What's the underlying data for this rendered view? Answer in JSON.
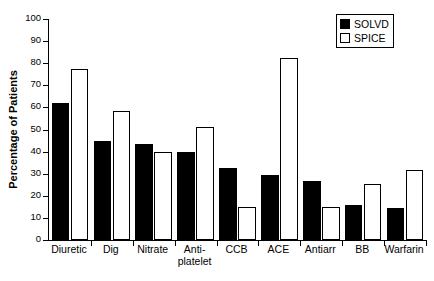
{
  "chart_data": {
    "type": "bar",
    "title": "",
    "xlabel": "",
    "ylabel": "Percentage of Patients",
    "ylim": [
      0,
      100
    ],
    "yticks": [
      0,
      10,
      20,
      30,
      40,
      50,
      60,
      70,
      80,
      90,
      100
    ],
    "grid": false,
    "legend_position": "top-right",
    "categories": [
      "Diuretic",
      "Dig",
      "Nitrate",
      "Anti-\nplatelet",
      "CCB",
      "ACE",
      "Antiarr",
      "BB",
      "Warfarin"
    ],
    "series": [
      {
        "name": "SOLVD",
        "color": "#000000",
        "style": "filled",
        "values": [
          62,
          45,
          43.5,
          40,
          32.5,
          29.5,
          26.5,
          16,
          14.5
        ]
      },
      {
        "name": "SPICE",
        "color": "#ffffff",
        "style": "outlined",
        "values": [
          77.5,
          58.5,
          40,
          51,
          15,
          82.5,
          15,
          25.5,
          31.5
        ]
      }
    ]
  },
  "legend": {
    "entries": [
      {
        "label": "SOLVD",
        "swatch": "filled-black-square"
      },
      {
        "label": "SPICE",
        "swatch": "outlined-white-square"
      }
    ]
  },
  "axis": {
    "y_title": "Percentage of Patients",
    "y_tick_labels": [
      "0",
      "10",
      "20",
      "30",
      "40",
      "50",
      "60",
      "70",
      "80",
      "90",
      "100"
    ]
  }
}
